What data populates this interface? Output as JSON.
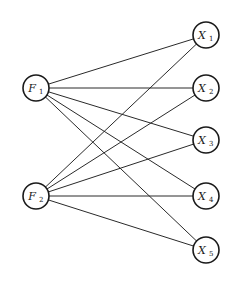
{
  "diagram": {
    "type": "bipartite-path-diagram",
    "colors": {
      "stroke": "#1a1a1a",
      "background": "#ffffff"
    },
    "nodes": [
      {
        "id": "F1",
        "base": "F",
        "sub": "1",
        "x": 36,
        "y": 88,
        "group": "factor"
      },
      {
        "id": "F2",
        "base": "F",
        "sub": "2",
        "x": 36,
        "y": 196,
        "group": "factor"
      },
      {
        "id": "X1",
        "base": "X",
        "sub": "1",
        "x": 206,
        "y": 35,
        "group": "indicator"
      },
      {
        "id": "X2",
        "base": "X",
        "sub": "2",
        "x": 206,
        "y": 88,
        "group": "indicator"
      },
      {
        "id": "X3",
        "base": "X",
        "sub": "3",
        "x": 206,
        "y": 140,
        "group": "indicator"
      },
      {
        "id": "X4",
        "base": "X",
        "sub": "4",
        "x": 206,
        "y": 196,
        "group": "indicator"
      },
      {
        "id": "X5",
        "base": "X",
        "sub": "5",
        "x": 206,
        "y": 250,
        "group": "indicator"
      }
    ],
    "node_radius": 13,
    "edges": [
      [
        "F1",
        "X1"
      ],
      [
        "F1",
        "X2"
      ],
      [
        "F1",
        "X3"
      ],
      [
        "F1",
        "X4"
      ],
      [
        "F1",
        "X5"
      ],
      [
        "F2",
        "X1"
      ],
      [
        "F2",
        "X2"
      ],
      [
        "F2",
        "X3"
      ],
      [
        "F2",
        "X4"
      ],
      [
        "F2",
        "X5"
      ]
    ]
  }
}
